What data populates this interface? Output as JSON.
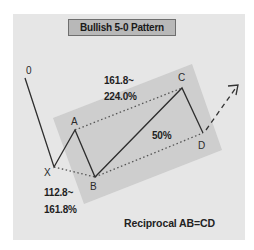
{
  "title": "Bullish 5-0 Pattern",
  "points": {
    "zero": {
      "label": "0",
      "x": 25,
      "y": 78
    },
    "X": {
      "label": "X",
      "x": 54,
      "y": 167
    },
    "A": {
      "label": "A",
      "x": 75,
      "y": 130
    },
    "B": {
      "label": "B",
      "x": 95,
      "y": 177
    },
    "C": {
      "label": "C",
      "x": 182,
      "y": 88
    },
    "D": {
      "label": "D",
      "x": 203,
      "y": 133
    }
  },
  "ratios": {
    "xc_line1": "161.8~",
    "xc_line2": "224.0%",
    "bd": "50%",
    "xb_line1": "112.8~",
    "xb_line2": "161.8%"
  },
  "caption": "Reciprocal AB=CD",
  "colors": {
    "card_bg": "#e6e6e6",
    "shade": "#c9c9c9",
    "title_bg": "#b8b8b8",
    "line": "#2e2e2e",
    "dotted": "#555555"
  }
}
